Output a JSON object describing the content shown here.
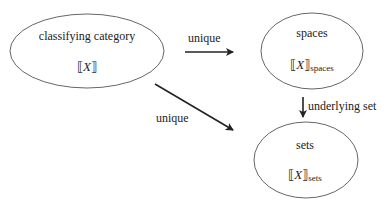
{
  "nodes": [
    {
      "id": "classifying",
      "title": "classifying category",
      "symbol": "X",
      "subscript": ""
    },
    {
      "id": "spaces",
      "title": "spaces",
      "symbol": "X",
      "subscript": "spaces"
    },
    {
      "id": "sets",
      "title": "sets",
      "symbol": "X",
      "subscript": "sets"
    }
  ],
  "edges": [
    {
      "from": "classifying",
      "to": "spaces",
      "label": "unique"
    },
    {
      "from": "classifying",
      "to": "sets",
      "label": "unique"
    },
    {
      "from": "spaces",
      "to": "sets",
      "label": "underlying set"
    }
  ],
  "glyphs": {
    "open": "⟦",
    "close": "⟧"
  }
}
